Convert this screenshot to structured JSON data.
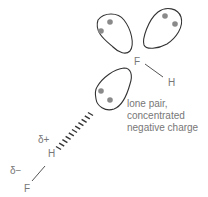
{
  "diagram": {
    "molecule_top": {
      "atom_f": "F",
      "atom_h": "H",
      "lone_pairs": 3
    },
    "molecule_bottom": {
      "atom_h": "H",
      "atom_f": "F",
      "charge_h": "δ+",
      "charge_f": "δ−"
    },
    "annotation": {
      "line1": "lone pair,",
      "line2": "concentrated",
      "line3": "negative charge"
    },
    "colors": {
      "outline": "#333333",
      "electron_dot": "#8a8a8a",
      "label_text": "#777777"
    }
  }
}
